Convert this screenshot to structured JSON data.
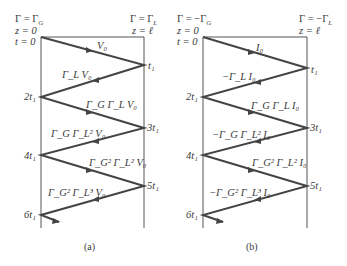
{
  "diagrams": [
    {
      "id": "a",
      "caption": "(a)",
      "left_header": {
        "gamma": "Γ = Γ",
        "gamma_sub": "G",
        "z": "z = 0",
        "t": "t = 0"
      },
      "right_header": {
        "gamma": "Γ = Γ",
        "gamma_sub": "L",
        "z": "z = ℓ"
      },
      "time_labels": [
        "t₁",
        "2t₁",
        "3t₁",
        "4t₁",
        "5t₁",
        "6t₁"
      ],
      "wave_labels": [
        "V₀",
        "Γ_L V₀",
        "Γ_G Γ_L V₀",
        "Γ_G Γ_L² V₀",
        "Γ_G² Γ_L² V₀",
        "Γ_G² Γ_L³ V₀"
      ]
    },
    {
      "id": "b",
      "caption": "(b)",
      "left_header": {
        "gamma": "Γ = −Γ",
        "gamma_sub": "G",
        "z": "z = 0",
        "t": "t = 0"
      },
      "right_header": {
        "gamma": "Γ = −Γ",
        "gamma_sub": "L",
        "z": "z = ℓ"
      },
      "time_labels": [
        "t₁",
        "2t₁",
        "3t₁",
        "4t₁",
        "5t₁",
        "6t₁"
      ],
      "wave_labels": [
        "I₀",
        "−Γ_L I₀",
        "Γ_G Γ_L I₀",
        "−Γ_G Γ_L² I₀",
        "Γ_G² Γ_L² I₀",
        "−Γ_G² Γ_L³ I₀"
      ]
    }
  ],
  "colors": {
    "line": "#444444",
    "text": "#3a3a3a",
    "background": "#ffffff"
  }
}
